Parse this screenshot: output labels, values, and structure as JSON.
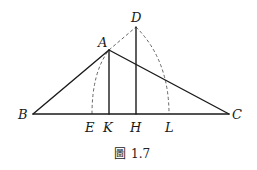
{
  "figure": {
    "caption_prefix": "圖",
    "caption_number": "1.7",
    "points": {
      "A": {
        "label": "A",
        "x": 109,
        "y": 50
      },
      "B": {
        "label": "B",
        "x": 33,
        "y": 114
      },
      "C": {
        "label": "C",
        "x": 229,
        "y": 114
      },
      "D": {
        "label": "D",
        "x": 136,
        "y": 27
      },
      "E": {
        "label": "E",
        "x": 92,
        "y": 114
      },
      "K": {
        "label": "K",
        "x": 109,
        "y": 114
      },
      "H": {
        "label": "H",
        "x": 136,
        "y": 114
      },
      "L": {
        "label": "L",
        "x": 169,
        "y": 114
      }
    },
    "segments_solid": [
      "AB",
      "AC",
      "BC",
      "AK",
      "DH"
    ],
    "segments_dashed": [
      "AD"
    ],
    "arcs_dashed": [
      "E to A",
      "D to L"
    ]
  }
}
